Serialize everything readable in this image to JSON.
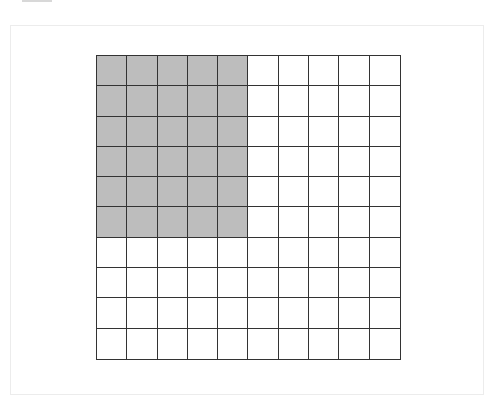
{
  "diagram": {
    "type": "area-model-grid",
    "rows": 10,
    "cols": 10,
    "shaded_rows": 6,
    "shaded_cols": 5,
    "shaded_count": 30,
    "total_cells": 100,
    "colors": {
      "shaded": "#bdbdbd",
      "unshaded": "#ffffff",
      "gridline": "#333333"
    }
  }
}
